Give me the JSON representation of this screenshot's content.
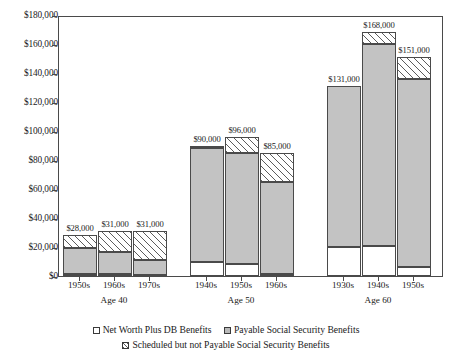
{
  "chart_data": {
    "type": "bar",
    "subtype": "stacked",
    "title": "",
    "xlabel": "",
    "ylabel": "",
    "ylim": [
      0,
      180000
    ],
    "ytick_step": 20000,
    "grid": false,
    "legend_position": "bottom",
    "value_prefix": "$",
    "ytick_labels": [
      "$0",
      "$20,000",
      "$40,000",
      "$60,000",
      "$80,000",
      "$100,000",
      "$120,000",
      "$140,000",
      "$160,000",
      "$180,000"
    ],
    "ytick_values": [
      0,
      20000,
      40000,
      60000,
      80000,
      100000,
      120000,
      140000,
      160000,
      180000
    ],
    "groups": [
      {
        "label": "Age 40",
        "categories": [
          "1950s",
          "1960s",
          "1970s"
        ]
      },
      {
        "label": "Age 50",
        "categories": [
          "1940s",
          "1950s",
          "1960s"
        ]
      },
      {
        "label": "Age 60",
        "categories": [
          "1930s",
          "1940s",
          "1950s"
        ]
      }
    ],
    "series": [
      {
        "name": "Net Worth Plus DB Benefits",
        "pattern": "open",
        "values": [
          1500,
          1500,
          1000,
          10000,
          8000,
          1500,
          20000,
          21000,
          6000
        ]
      },
      {
        "name": "Payable Social Security Benefits",
        "pattern": "gray",
        "values": [
          18000,
          15000,
          10000,
          78000,
          77000,
          63000,
          111000,
          139000,
          130000
        ]
      },
      {
        "name": "Scheduled but not Payable Social Security Benefits",
        "pattern": "hatched",
        "values": [
          8500,
          14500,
          20000,
          2000,
          11000,
          20500,
          0,
          8000,
          15000
        ]
      }
    ],
    "bars": [
      {
        "group": "Age 40",
        "category": "1950s",
        "total_label": "$28,000",
        "total": 28000,
        "net_worth_db": 1500,
        "payable_ss": 18000,
        "scheduled_not_payable_ss": 8500
      },
      {
        "group": "Age 40",
        "category": "1960s",
        "total_label": "$31,000",
        "total": 31000,
        "net_worth_db": 1500,
        "payable_ss": 15000,
        "scheduled_not_payable_ss": 14500
      },
      {
        "group": "Age 40",
        "category": "1970s",
        "total_label": "$31,000",
        "total": 31000,
        "net_worth_db": 1000,
        "payable_ss": 10000,
        "scheduled_not_payable_ss": 20000
      },
      {
        "group": "Age 50",
        "category": "1940s",
        "total_label": "$90,000",
        "total": 90000,
        "net_worth_db": 10000,
        "payable_ss": 78000,
        "scheduled_not_payable_ss": 2000
      },
      {
        "group": "Age 50",
        "category": "1950s",
        "total_label": "$96,000",
        "total": 96000,
        "net_worth_db": 8000,
        "payable_ss": 77000,
        "scheduled_not_payable_ss": 11000
      },
      {
        "group": "Age 50",
        "category": "1960s",
        "total_label": "$85,000",
        "total": 85000,
        "net_worth_db": 1500,
        "payable_ss": 63000,
        "scheduled_not_payable_ss": 20500
      },
      {
        "group": "Age 60",
        "category": "1930s",
        "total_label": "$131,000",
        "total": 131000,
        "net_worth_db": 20000,
        "payable_ss": 111000,
        "scheduled_not_payable_ss": 0
      },
      {
        "group": "Age 60",
        "category": "1940s",
        "total_label": "$168,000",
        "total": 168000,
        "net_worth_db": 21000,
        "payable_ss": 139000,
        "scheduled_not_payable_ss": 8000
      },
      {
        "group": "Age 60",
        "category": "1950s",
        "total_label": "$151,000",
        "total": 151000,
        "net_worth_db": 6000,
        "payable_ss": 130000,
        "scheduled_not_payable_ss": 15000
      }
    ]
  },
  "legend": {
    "items": [
      {
        "label": "Net Worth Plus DB Benefits",
        "swatch": "open"
      },
      {
        "label": "Payable Social Security Benefits",
        "swatch": "gray"
      },
      {
        "label": "Scheduled but not Payable Social Security Benefits",
        "swatch": "hatched"
      }
    ]
  },
  "colors": {
    "payable_fill": "#c3c3c3",
    "open_fill": "#ffffff",
    "hatch_stroke": "#5c5c5c",
    "axis": "#4a4a4a",
    "text": "#1a1a1a",
    "background": "#ffffff"
  }
}
